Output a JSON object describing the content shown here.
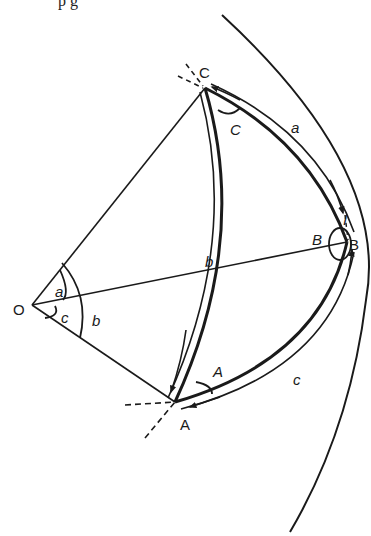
{
  "figure": {
    "type": "spherical-triangle-diagram",
    "top_partial_text": "p                    g",
    "points": {
      "O": {
        "label": "O",
        "x": 32,
        "y": 305
      },
      "A": {
        "label": "A",
        "x": 175,
        "y": 402
      },
      "B": {
        "label": "B",
        "x": 347,
        "y": 242
      },
      "C": {
        "label": "C",
        "x": 205,
        "y": 88
      }
    },
    "vertex_labels": {
      "A": "A",
      "B": "B",
      "C": "C",
      "O": "O"
    },
    "angle_labels": {
      "A": "A",
      "B": "B",
      "C": "C"
    },
    "side_labels": {
      "a": "a",
      "b": "b",
      "c": "c"
    },
    "center_angle_labels": {
      "a": "a",
      "c": "c",
      "b": "b"
    },
    "tangent_marker": "I",
    "colors": {
      "ink": "#1a1a1a",
      "background": "#ffffff"
    }
  }
}
